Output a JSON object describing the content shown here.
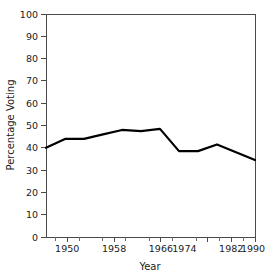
{
  "chart_data": {
    "type": "line",
    "title": "",
    "xlabel": "Year",
    "ylabel": "Percentage Voting",
    "xlim": [
      1946,
      1990
    ],
    "ylim": [
      0,
      100
    ],
    "grid": false,
    "legend": false,
    "x_major_ticks": [
      1950,
      1958,
      1966,
      1974,
      1982,
      1990
    ],
    "x_major_tick_labels": [
      "1950",
      "1958",
      "1966",
      "1974",
      "1982",
      "1990"
    ],
    "x_minor_tick_step": 2,
    "y_ticks": [
      0,
      10,
      20,
      30,
      40,
      50,
      60,
      70,
      80,
      90,
      100
    ],
    "y_tick_labels": [
      "0",
      "10",
      "20",
      "30",
      "40",
      "50",
      "60",
      "70",
      "80",
      "90",
      "100"
    ],
    "series": [
      {
        "name": "Percentage Voting",
        "color": "#000000",
        "x": [
          1946,
          1950,
          1954,
          1958,
          1962,
          1966,
          1970,
          1974,
          1978,
          1982,
          1986,
          1990
        ],
        "values": [
          40,
          44,
          44,
          46,
          48,
          47.5,
          48.5,
          38.5,
          38.5,
          41.5,
          38,
          34.5
        ]
      }
    ]
  },
  "axes": {
    "y_title": "Percentage Voting",
    "x_title": "Year"
  }
}
